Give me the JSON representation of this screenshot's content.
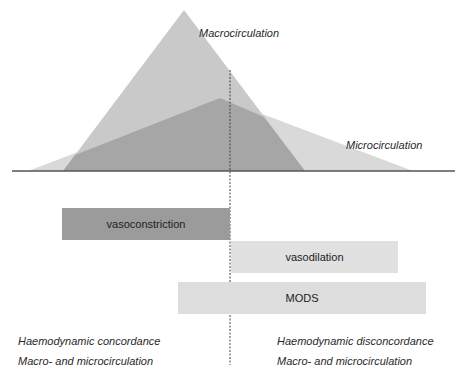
{
  "diagram": {
    "curves": {
      "macro_label": "Macrocirculation",
      "micro_label": "Microcirculation"
    },
    "bars": [
      {
        "label": "vasoconstriction",
        "color": "#9b9b9b"
      },
      {
        "label": "vasodilation",
        "color": "#e1e1e1"
      },
      {
        "label": "MODS",
        "color": "#dddddd"
      }
    ],
    "captions": {
      "left": {
        "line1": "Haemodynamic concordance",
        "line2": "Macro- and microcirculation"
      },
      "right": {
        "line1": "Haemodynamic disconcordance",
        "line2": "Macro- and microcirculation"
      }
    },
    "colors": {
      "macro_fill": "#c9c9c9",
      "micro_fill": "#d9d9d9",
      "overlap_fill": "#a6a6a6",
      "baseline": "#555555",
      "divider": "#444444"
    }
  }
}
